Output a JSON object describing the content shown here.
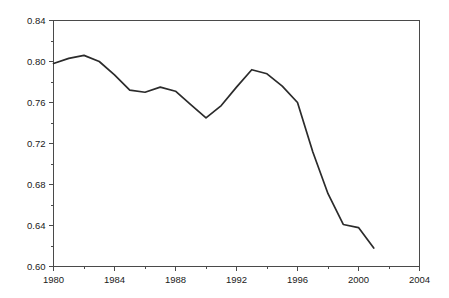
{
  "chart_data": {
    "type": "line",
    "title": "",
    "subtitle": "",
    "xlabel": "",
    "ylabel": "",
    "xlim": [
      1980,
      2004
    ],
    "ylim": [
      0.6,
      0.84
    ],
    "grid": false,
    "legend": null,
    "legend_position": "none",
    "line_color": "#2b2b2b",
    "frame_color": "#4a4a4a",
    "background_color": "#ffffff",
    "x_ticks": [
      1980,
      1984,
      1988,
      1992,
      1996,
      2000,
      2004
    ],
    "x_tick_labels": [
      "1980",
      "1984",
      "1988",
      "1992",
      "1996",
      "2000",
      "2004"
    ],
    "x_minor_ticks": [
      1982,
      1986,
      1990,
      1994,
      1998,
      2002
    ],
    "y_ticks": [
      0.6,
      0.64,
      0.68,
      0.72,
      0.76,
      0.8,
      0.84
    ],
    "y_tick_labels": [
      "0.60",
      "0.64",
      "0.68",
      "0.72",
      "0.76",
      "0.80",
      "0.84"
    ],
    "y_minor_ticks": [
      0.62,
      0.66,
      0.7,
      0.74,
      0.78,
      0.82
    ],
    "series": [
      {
        "name": "series-1",
        "x": [
          1980,
          1981,
          1982,
          1983,
          1984,
          1985,
          1986,
          1987,
          1988,
          1989,
          1990,
          1991,
          1992,
          1993,
          1994,
          1995,
          1996,
          1997,
          1998,
          1999,
          2000,
          2001
        ],
        "values": [
          0.798,
          0.803,
          0.806,
          0.8,
          0.787,
          0.772,
          0.77,
          0.775,
          0.771,
          0.758,
          0.745,
          0.757,
          0.775,
          0.792,
          0.788,
          0.776,
          0.76,
          0.712,
          0.671,
          0.641,
          0.638,
          0.618
        ]
      }
    ]
  },
  "axes": {
    "x_axis_name": "year-axis",
    "y_axis_name": "value-axis"
  }
}
